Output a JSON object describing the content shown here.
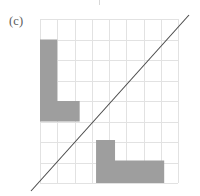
{
  "figure": {
    "panel_label": "(c)",
    "colors": {
      "shape_fill": "#9e9e9e",
      "grid_line": "#e2e2e2",
      "diagonal_line": "#4a4a4a",
      "label_text": "#5b5b5b",
      "background": "#ffffff"
    },
    "grid": {
      "columns": 8,
      "rows": 8,
      "x": 40,
      "y": 19,
      "width": 138,
      "height": 164,
      "cell_width": 17.25,
      "cell_height": 20.5,
      "show_grid": true
    },
    "diagonal": {
      "name": "mirror-axis",
      "x1": 31,
      "y1": 191,
      "x2": 189,
      "y2": 15
    },
    "shapes": [
      {
        "name": "upper-left-L",
        "points": [
          [
            0,
            1
          ],
          [
            1,
            1
          ],
          [
            1,
            4
          ],
          [
            2.3,
            4
          ],
          [
            2.3,
            5
          ],
          [
            0,
            5
          ]
        ]
      },
      {
        "name": "lower-right-L",
        "points": [
          [
            3.25,
            5.9
          ],
          [
            4.35,
            5.9
          ],
          [
            4.35,
            6.9
          ],
          [
            7.2,
            6.9
          ],
          [
            7.2,
            8
          ],
          [
            3.25,
            8
          ]
        ]
      }
    ]
  }
}
